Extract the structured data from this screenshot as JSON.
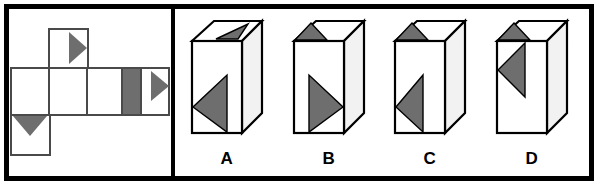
{
  "puzzle": {
    "type": "cube-folding-spatial-reasoning",
    "colors": {
      "frame": "#000000",
      "outline": "#4a4a4a",
      "shape_fill": "#6e6e6e",
      "face_fill": "#ffffff",
      "background": "#ffffff",
      "box_outline": "#000000",
      "box_side_fill": "#f2f2f2"
    },
    "net_panel": {
      "name": "unfolded-cube-net",
      "description": "Flattened net of a cube made of six squares with gray markings",
      "faces": [
        {
          "id": "top-square",
          "row": "top",
          "col": 2,
          "marking": "right-pointing-gray-triangle-at-right"
        },
        {
          "id": "middle-square-1",
          "row": "middle",
          "col": 1,
          "marking": "blank"
        },
        {
          "id": "middle-square-2",
          "row": "middle",
          "col": 2,
          "marking": "blank"
        },
        {
          "id": "middle-square-3",
          "row": "middle",
          "col": 3,
          "marking": "blank"
        },
        {
          "id": "middle-square-4",
          "row": "middle",
          "col": 4,
          "marking": "gray-vertical-band"
        },
        {
          "id": "middle-square-5",
          "row": "middle",
          "col": 5,
          "marking": "right-pointing-gray-triangle-at-right"
        },
        {
          "id": "bottom-square",
          "row": "bottom",
          "col": 1,
          "marking": "down-pointing-gray-triangle-at-top"
        }
      ]
    },
    "options": [
      {
        "id": "option-a",
        "label": "A",
        "front_face_marking": "left-pointing-gray-triangle-lower",
        "top_face_marking": "gray-triangle-on-top-face"
      },
      {
        "id": "option-b",
        "label": "B",
        "front_face_marking": "right-pointing-gray-triangle-lower",
        "top_face_marking": "gray-triangle-on-top-face-left"
      },
      {
        "id": "option-c",
        "label": "C",
        "front_face_marking": "left-pointing-gray-triangle-lower",
        "top_face_marking": "gray-triangle-on-top-face-left"
      },
      {
        "id": "option-d",
        "label": "D",
        "front_face_marking": "left-pointing-gray-triangle-upper",
        "top_face_marking": "gray-triangle-on-top-face-left"
      }
    ]
  }
}
